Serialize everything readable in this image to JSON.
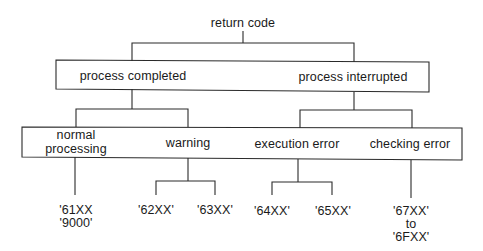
{
  "diagram": {
    "root": {
      "label": "return code"
    },
    "level1": [
      {
        "label": "process completed"
      },
      {
        "label": "process interrupted"
      }
    ],
    "level2": [
      {
        "label_line1": "normal",
        "label_line2": "processing",
        "parent": "process completed"
      },
      {
        "label": "warning",
        "parent": "process completed"
      },
      {
        "label": "execution error",
        "parent": "process interrupted"
      },
      {
        "label": "checking error",
        "parent": "process interrupted"
      }
    ],
    "codes": {
      "normal_processing": {
        "line1": "'61XX",
        "line2": "'9000'"
      },
      "warning": [
        "'62XX'",
        "'63XX'"
      ],
      "execution_error": [
        "'64XX'",
        "'65XX'"
      ],
      "checking_error": {
        "line1": "'67XX'",
        "line2": "to",
        "line3": "'6FXX'"
      }
    },
    "colors": {
      "line": "#2a2a2a",
      "text": "#1a1a1a",
      "background": "#ffffff"
    }
  }
}
